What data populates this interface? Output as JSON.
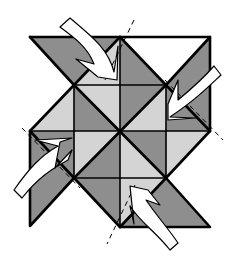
{
  "diagram": {
    "colors": {
      "dark": "#8e8e8e",
      "light": "#d4d4d4",
      "line": "#000000",
      "arrow": "#ffffff",
      "background": "#ffffff"
    },
    "arrows": [
      {
        "id": "arrow-top-left",
        "direction": "down-right"
      },
      {
        "id": "arrow-top-right",
        "direction": "down-left"
      },
      {
        "id": "arrow-bottom-left",
        "direction": "up-right"
      },
      {
        "id": "arrow-bottom-right",
        "direction": "up-left"
      }
    ],
    "fold_lines": 4
  }
}
